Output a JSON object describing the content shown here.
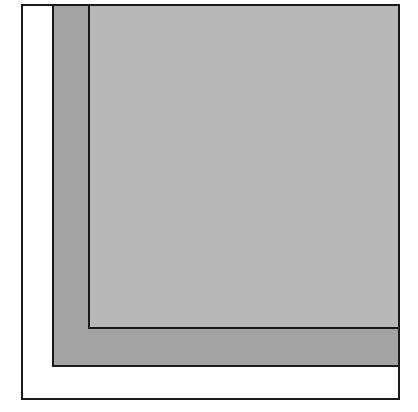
{
  "diagram": {
    "shapes": [
      {
        "id": "outer",
        "fill": "#ffffff",
        "stroke": "#1a1a1a"
      },
      {
        "id": "middle",
        "fill": "#a3a3a3",
        "stroke": "#1a1a1a"
      },
      {
        "id": "inner",
        "fill": "#b8b8b8",
        "stroke": "#1a1a1a"
      }
    ]
  }
}
